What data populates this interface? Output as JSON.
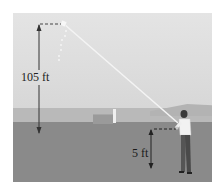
{
  "figure": {
    "type": "kite-height-illustration",
    "labels": {
      "kite_height": "105 ft",
      "hand_height": "5 ft"
    },
    "colors": {
      "sky": "#dcdcdc",
      "hills": "#b9b9b9",
      "ground": "#8a8a8a",
      "string": "#f2f2f2",
      "arrow": "#333333"
    }
  }
}
